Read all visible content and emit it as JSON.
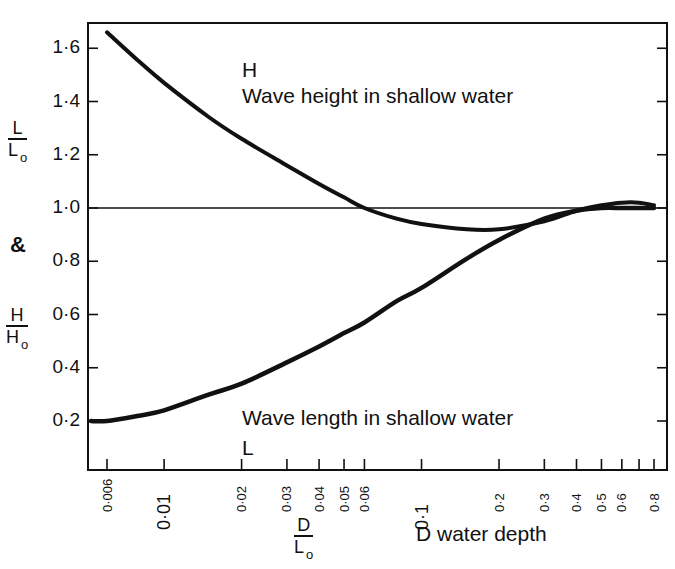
{
  "chart_data": {
    "type": "line",
    "title": "",
    "xscale": "log",
    "xlabel": "D/Lo",
    "xlabel_note": "D water depth",
    "ylabel_top": "L/Lo",
    "ylabel_joiner": "&",
    "ylabel_bottom": "H/Ho",
    "xlim": [
      0.0052,
      0.9
    ],
    "ylim": [
      0.0,
      1.7
    ],
    "x_ticks": [
      {
        "value": 0.006,
        "label": "0·006",
        "big": false
      },
      {
        "value": 0.01,
        "label": "0·01",
        "big": true
      },
      {
        "value": 0.02,
        "label": "0·02",
        "big": false
      },
      {
        "value": 0.03,
        "label": "0·03",
        "big": false
      },
      {
        "value": 0.04,
        "label": "0·04",
        "big": false
      },
      {
        "value": 0.05,
        "label": "0·05",
        "big": false
      },
      {
        "value": 0.06,
        "label": "0·06",
        "big": false
      },
      {
        "value": 0.1,
        "label": "0·1",
        "big": true
      },
      {
        "value": 0.2,
        "label": "0·2",
        "big": false
      },
      {
        "value": 0.3,
        "label": "0·3",
        "big": false
      },
      {
        "value": 0.4,
        "label": "0·4",
        "big": false
      },
      {
        "value": 0.5,
        "label": "0·5",
        "big": false
      },
      {
        "value": 0.6,
        "label": "0·6",
        "big": false
      },
      {
        "value": 0.7,
        "label": "",
        "big": false
      },
      {
        "value": 0.8,
        "label": "0·8",
        "big": false
      }
    ],
    "y_ticks": [
      {
        "value": 0.2,
        "label": "0·2"
      },
      {
        "value": 0.4,
        "label": "0·4"
      },
      {
        "value": 0.6,
        "label": "0·6"
      },
      {
        "value": 0.8,
        "label": "0·8"
      },
      {
        "value": 1.0,
        "label": "1·0"
      },
      {
        "value": 1.2,
        "label": "1·2"
      },
      {
        "value": 1.4,
        "label": "1·4"
      },
      {
        "value": 1.6,
        "label": "1·6"
      }
    ],
    "reference_line": {
      "y": 1.0
    },
    "grid": false,
    "legend": "none (inline annotations)",
    "series": [
      {
        "name": "H Wave height in shallow water",
        "x": [
          0.006,
          0.008,
          0.01,
          0.015,
          0.02,
          0.03,
          0.04,
          0.05,
          0.06,
          0.08,
          0.1,
          0.15,
          0.2,
          0.3,
          0.4,
          0.5,
          0.6,
          0.7,
          0.8
        ],
        "y": [
          1.66,
          1.55,
          1.47,
          1.34,
          1.26,
          1.16,
          1.09,
          1.04,
          1.0,
          0.96,
          0.94,
          0.92,
          0.92,
          0.95,
          0.99,
          1.01,
          1.02,
          1.02,
          1.01
        ]
      },
      {
        "name": "L Wave length in shallow water",
        "x": [
          0.0052,
          0.006,
          0.008,
          0.01,
          0.015,
          0.02,
          0.03,
          0.04,
          0.05,
          0.06,
          0.08,
          0.1,
          0.15,
          0.2,
          0.3,
          0.4,
          0.5,
          0.6,
          0.7,
          0.8
        ],
        "y": [
          0.2,
          0.2,
          0.22,
          0.24,
          0.3,
          0.34,
          0.42,
          0.48,
          0.53,
          0.57,
          0.65,
          0.7,
          0.81,
          0.88,
          0.96,
          0.99,
          1.0,
          1.0,
          1.0,
          1.0
        ]
      }
    ]
  },
  "labels": {
    "ylabel_top": {
      "num": "L",
      "den": "L",
      "sub": "o"
    },
    "ylabel_joiner": "&",
    "ylabel_bottom": {
      "num": "H",
      "den": "H",
      "sub": "o"
    },
    "xlabel": {
      "num": "D",
      "den": "L",
      "sub": "o"
    },
    "xlabel_note": "D water depth",
    "height_letter": "H",
    "height_caption": "Wave height in shallow water",
    "length_caption": "Wave length in shallow water",
    "length_letter": "L"
  }
}
